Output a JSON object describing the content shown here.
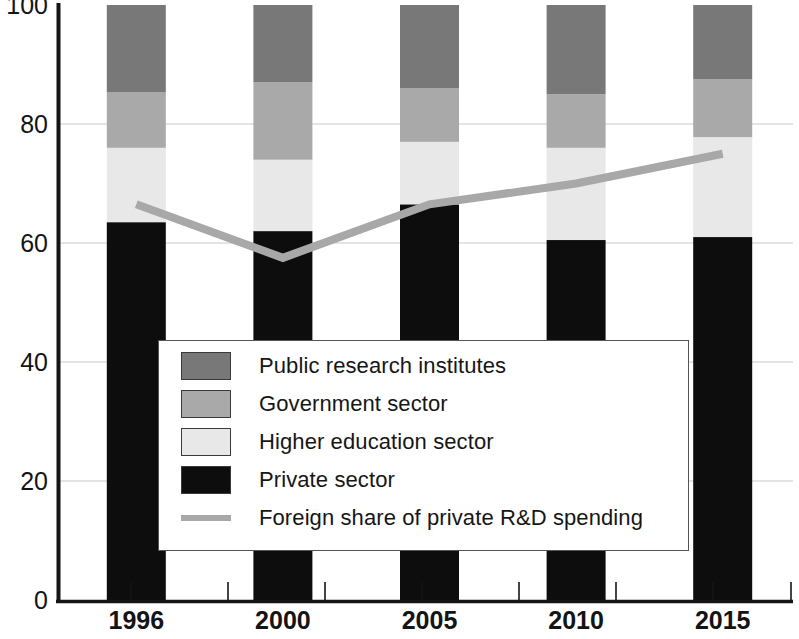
{
  "chart_data": {
    "type": "bar",
    "title": "",
    "subtitle": "",
    "xlabel": "",
    "ylabel": "",
    "categories": [
      "1996",
      "2000",
      "2005",
      "2010",
      "2015"
    ],
    "ylim": [
      0,
      100
    ],
    "yticks": [
      0,
      20,
      40,
      60,
      80,
      100
    ],
    "grid": true,
    "stacked": true,
    "legend_position": "inside-center",
    "series": [
      {
        "name": "Private sector",
        "type": "bar",
        "color": "#0d0d0d",
        "values": [
          63.5,
          62.0,
          66.5,
          60.5,
          61.0
        ]
      },
      {
        "name": "Higher education sector",
        "type": "bar",
        "color": "#e8e8e8",
        "values": [
          12.5,
          12.0,
          10.5,
          15.5,
          16.8
        ]
      },
      {
        "name": "Government sector",
        "type": "bar",
        "color": "#a9a9a9",
        "values": [
          9.3,
          13.0,
          9.0,
          9.0,
          9.7
        ]
      },
      {
        "name": "Public research institutes",
        "type": "bar",
        "color": "#787878",
        "values": [
          14.7,
          13.0,
          14.0,
          15.0,
          12.5
        ]
      },
      {
        "name": "Foreign share of private R&D spending",
        "type": "line",
        "color": "#a8a8a8",
        "values": [
          66.5,
          57.5,
          66.5,
          70.0,
          75.0
        ]
      }
    ]
  },
  "axes": {
    "y_tick_labels": [
      "100",
      "80",
      "60",
      "40",
      "20",
      "0"
    ],
    "x_tick_labels": [
      "1996",
      "2000",
      "2005",
      "2010",
      "2015"
    ]
  },
  "legend": {
    "items": [
      {
        "label": "Public research institutes",
        "marker": "swatch",
        "color": "#787878"
      },
      {
        "label": "Government sector",
        "marker": "swatch",
        "color": "#a9a9a9"
      },
      {
        "label": "Higher education sector",
        "marker": "swatch",
        "color": "#e8e8e8"
      },
      {
        "label": "Private sector",
        "marker": "swatch",
        "color": "#0d0d0d"
      },
      {
        "label": "Foreign share of private R&D spending",
        "marker": "line",
        "color": "#a8a8a8"
      }
    ]
  }
}
